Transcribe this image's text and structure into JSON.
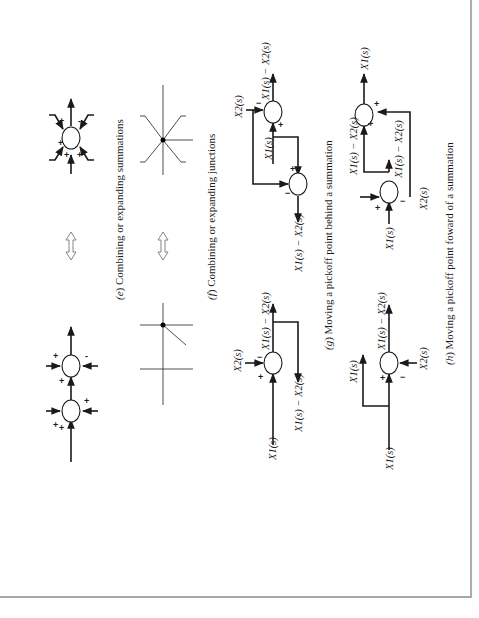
{
  "figure": {
    "orientation": "rotated-90-ccw",
    "panels": [
      {
        "id": "e",
        "letter": "e",
        "caption": "Combining or expanding summations",
        "left_signs": [
          "+",
          "+",
          "+",
          "+",
          "+",
          "-"
        ],
        "right_signs": [
          "+",
          "+",
          "+",
          "+",
          "-"
        ],
        "equivalence_symbol": "double-arrow"
      },
      {
        "id": "f",
        "letter": "f",
        "caption": "Combining or expanding junctions",
        "equivalence_symbol": "double-arrow"
      },
      {
        "id": "g",
        "letter": "g",
        "caption": "Moving a pickoff point behind a summation",
        "left": {
          "input": "X1(s)",
          "subtract": "X2(s)",
          "output": "X1(s) − X2(s)",
          "pickoff_output": "X1(s) − X2(s)",
          "signs": [
            "+",
            "−"
          ]
        },
        "right": {
          "input": "X1(s)",
          "subtract": "X2(s)",
          "output": "X1(s) − X2(s)",
          "pickoff_output": "X1(s) − X2(s)",
          "signs_top": [
            "+",
            "−"
          ],
          "signs_bottom": [
            "+",
            "−"
          ]
        }
      },
      {
        "id": "h",
        "letter": "h",
        "caption": "Moving a pickoff point foward of a summation",
        "left": {
          "input": "X1(s)",
          "pickoff_output": "X1(s)",
          "subtract": "X2(s)",
          "output": "X1(s) − X2(s)",
          "signs": [
            "+",
            "−"
          ]
        },
        "right": {
          "input": "X1(s)",
          "subtract": "X2(s)",
          "mid_output": "X1(s) − X2(s)",
          "mid_label": "X1(s) − X2(s)",
          "output": "X1(s)",
          "signs_first": [
            "+",
            "−"
          ],
          "signs_second": [
            "+",
            "+"
          ]
        }
      }
    ]
  },
  "labels": {
    "x1": "X",
    "x2": "X",
    "s": "(s)",
    "minus": "−",
    "plus": "+",
    "sub1": "1",
    "sub2": "2"
  },
  "colors": {
    "ink": "#1a1a1a",
    "border": "#8a8a8a",
    "background": "#ffffff"
  }
}
